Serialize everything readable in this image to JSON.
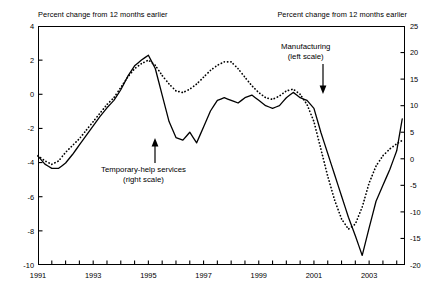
{
  "header": {
    "left_label": "Percent change from 12 months earlier",
    "right_label": "Percent change from 12 months earlier"
  },
  "annotations": {
    "manufacturing": {
      "line1": "Manufacturing",
      "line2": "(left scale)"
    },
    "temporary": {
      "line1": "Temporary-help services",
      "line2": "(right scale)"
    }
  },
  "axes": {
    "left_ticks": [
      "4",
      "2",
      "0",
      "-2",
      "-4",
      "-6",
      "-8",
      "-10"
    ],
    "right_ticks": [
      "25",
      "20",
      "15",
      "10",
      "5",
      "0",
      "-5",
      "-10",
      "-15",
      "-20"
    ],
    "x_ticks": [
      "1991",
      "1993",
      "1995",
      "1997",
      "1999",
      "2001",
      "2003"
    ]
  },
  "chart_data": {
    "type": "line",
    "title": "",
    "xlabel": "",
    "ylabel": "Percent change from 12 months earlier",
    "y2label": "Percent change from 12 months earlier",
    "xlim": [
      1991.0,
      2004.3
    ],
    "ylim": [
      -10,
      4
    ],
    "y2lim": [
      -20,
      25
    ],
    "grid": false,
    "legend": "annotations",
    "left_axis_ticks": [
      4,
      2,
      0,
      -2,
      -4,
      -6,
      -8,
      -10
    ],
    "right_axis_ticks": [
      25,
      20,
      15,
      10,
      5,
      0,
      -5,
      -10,
      -15,
      -20
    ],
    "x_axis_ticks": [
      1991,
      1993,
      1995,
      1997,
      1999,
      2001,
      2003
    ],
    "x_minor_tick_interval": 0.5,
    "series": [
      {
        "name": "Manufacturing",
        "axis": "left",
        "style": "dotted",
        "color": "#000000",
        "x": [
          1991.0,
          1991.25,
          1991.5,
          1991.75,
          1992.0,
          1992.25,
          1992.5,
          1992.75,
          1993.0,
          1993.25,
          1993.5,
          1993.75,
          1994.0,
          1994.25,
          1994.5,
          1994.75,
          1995.0,
          1995.25,
          1995.5,
          1995.75,
          1996.0,
          1996.25,
          1996.5,
          1996.75,
          1997.0,
          1997.25,
          1997.5,
          1997.75,
          1998.0,
          1998.25,
          1998.5,
          1998.75,
          1999.0,
          1999.25,
          1999.5,
          1999.75,
          2000.0,
          2000.25,
          2000.5,
          2000.75,
          2001.0,
          2001.25,
          2001.5,
          2001.75,
          2002.0,
          2002.25,
          2002.5,
          2002.75,
          2003.0,
          2003.25,
          2003.5,
          2003.75,
          2004.0,
          2004.2
        ],
        "values": [
          -3.6,
          -3.9,
          -4.1,
          -3.9,
          -3.4,
          -3.0,
          -2.6,
          -2.1,
          -1.6,
          -1.1,
          -0.6,
          -0.2,
          0.4,
          1.0,
          1.5,
          1.8,
          2.0,
          1.7,
          1.1,
          0.6,
          0.2,
          0.1,
          0.3,
          0.6,
          1.0,
          1.4,
          1.7,
          1.9,
          1.9,
          1.5,
          1.0,
          0.5,
          0.1,
          -0.2,
          -0.3,
          -0.1,
          0.2,
          0.3,
          0.0,
          -0.6,
          -1.6,
          -3.2,
          -4.8,
          -6.2,
          -7.3,
          -7.9,
          -7.6,
          -6.6,
          -5.2,
          -4.2,
          -3.6,
          -3.2,
          -2.9,
          -2.7
        ]
      },
      {
        "name": "Temporary-help services",
        "axis": "right",
        "style": "solid",
        "color": "#000000",
        "x": [
          1991.0,
          1991.25,
          1991.5,
          1991.75,
          1992.0,
          1992.25,
          1992.5,
          1992.75,
          1993.0,
          1993.25,
          1993.5,
          1993.75,
          1994.0,
          1994.25,
          1994.5,
          1994.75,
          1995.0,
          1995.25,
          1995.5,
          1995.75,
          1996.0,
          1996.25,
          1996.5,
          1996.75,
          1997.0,
          1997.25,
          1997.5,
          1997.75,
          1998.0,
          1998.25,
          1998.5,
          1998.75,
          1999.0,
          1999.25,
          1999.5,
          1999.75,
          2000.0,
          2000.25,
          2000.5,
          2000.75,
          2001.0,
          2001.25,
          2001.5,
          2001.75,
          2002.0,
          2002.25,
          2002.5,
          2002.75,
          2003.0,
          2003.25,
          2003.5,
          2003.75,
          2004.0,
          2004.2
        ],
        "values": [
          0.5,
          -1.0,
          -1.8,
          -1.8,
          -0.8,
          0.8,
          2.6,
          4.4,
          6.2,
          8.0,
          9.6,
          11.0,
          13.0,
          15.5,
          17.5,
          18.6,
          19.5,
          17.0,
          12.0,
          7.0,
          4.0,
          3.5,
          5.0,
          3.0,
          6.0,
          9.0,
          11.0,
          11.5,
          11.0,
          10.5,
          11.5,
          12.0,
          11.0,
          10.0,
          9.5,
          10.0,
          11.5,
          12.5,
          11.5,
          11.0,
          9.5,
          5.0,
          1.0,
          -3.0,
          -7.0,
          -11.0,
          -14.5,
          -18.2,
          -13.0,
          -8.0,
          -5.0,
          -2.0,
          1.5,
          7.5
        ]
      }
    ]
  }
}
